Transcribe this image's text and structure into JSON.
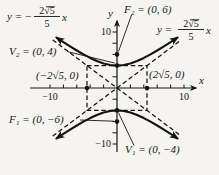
{
  "figure": {
    "colors": {
      "background": "#f5f4f0",
      "ink": "#141414"
    },
    "axes": {
      "x_label": "x",
      "y_label": "y"
    },
    "tick_labels": {
      "x_neg": "−10",
      "x_pos": "10",
      "y_pos": "10",
      "y_neg": "−10"
    },
    "points": {
      "focus_upper": "F₂ = (0, 6)",
      "vertex_upper": "V₂ = (0, 4)",
      "x_intercept_left": "(−2√5, 0)",
      "x_intercept_right": "(2√5, 0)",
      "focus_lower": "F₁ = (0, −6)",
      "vertex_lower": "V₁ = (0, −4)"
    },
    "asymptote_labels": {
      "negative": {
        "prefix": "y = −",
        "numerator": "2√5",
        "denominator": "5",
        "suffix": "x"
      },
      "positive": {
        "prefix": "y =",
        "numerator": "2√5",
        "denominator": "5",
        "suffix": "x"
      }
    }
  }
}
